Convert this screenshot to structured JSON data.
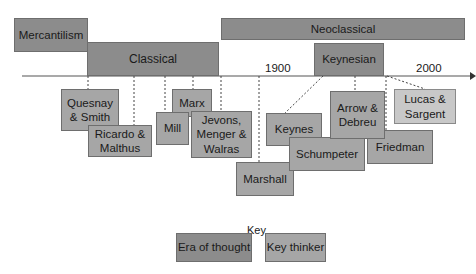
{
  "eras": {
    "mercantilism": "Mercantilism",
    "classical": "Classical",
    "neoclassical": "Neoclassical",
    "keynesian": "Keynesian"
  },
  "timeline": {
    "year_1900": "1900",
    "year_2000": "2000"
  },
  "thinkers": {
    "quesnay_smith": "Quesnay & Smith",
    "ricardo_malthus": "Ricardo & Malthus",
    "mill": "Mill",
    "marx": "Marx",
    "jevons_menger_walras": "Jevons, Menger & Walras",
    "marshall": "Marshall",
    "keynes": "Keynes",
    "schumpeter": "Schumpeter",
    "arrow_debreu": "Arrow & Debreu",
    "friedman": "Friedman",
    "lucas_sargent": "Lucas & Sargent"
  },
  "key": {
    "title": "Key",
    "era_label": "Era of thought",
    "thinker_label": "Key thinker"
  },
  "colors": {
    "era": "#8c8c8c",
    "thinker": "#a6a6a6",
    "recent_thinker": "#c8c8c8"
  }
}
